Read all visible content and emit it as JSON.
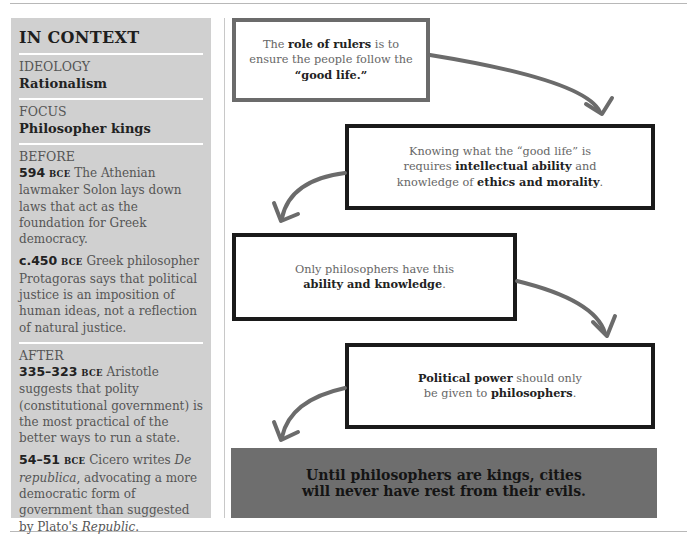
{
  "sidebar": {
    "title": "IN CONTEXT",
    "ideology": {
      "label": "IDEOLOGY",
      "value": "Rationalism"
    },
    "focus": {
      "label": "FOCUS",
      "value": "Philosopher kings"
    },
    "before": {
      "label": "BEFORE",
      "entries": [
        {
          "date": "594",
          "era": "BCE",
          "text": " The Athenian lawmaker Solon lays down laws that act as the foundation for Greek democracy."
        },
        {
          "date": "c.450",
          "era": "BCE",
          "text": " Greek philosopher Protagoras says that political justice is an imposition of human ideas, not a reflection of natural justice."
        }
      ]
    },
    "after": {
      "label": "AFTER",
      "entries": [
        {
          "date": "335–323",
          "era": "BCE",
          "text": " Aristotle suggests that polity (constitutional government) is the most practical of the better ways to run a state."
        },
        {
          "date": "54–51",
          "era": "BCE",
          "text_a": " Cicero writes ",
          "italic_a": "De republica",
          "text_b": ", advocating a more democratic form of government than suggested by Plato's ",
          "italic_b": "Republic",
          "text_c": "."
        }
      ]
    }
  },
  "flow": {
    "box1": {
      "t1": "The ",
      "b1": "role of rulers",
      "t2": " is to ensure the people follow the ",
      "b2": "“good life.”"
    },
    "box2": {
      "t1": "Knowing what the “good life” is requires ",
      "b1": "intellectual ability",
      "t2": " and knowledge of ",
      "b2": "ethics and morality",
      "t3": "."
    },
    "box3": {
      "t1": "Only philosophers have this ",
      "b1": "ability and knowledge",
      "t2": "."
    },
    "box4": {
      "b1": "Political power",
      "t1": " should only be given to ",
      "b2": "philosophers",
      "t2": "."
    },
    "conclusion": {
      "line1": "Until philosophers are kings, cities",
      "line2": "will never have rest from their evils."
    }
  },
  "colors": {
    "sidebar_bg": "#d0d0d0",
    "conclusion_bg": "#6e6e6e",
    "arrow": "#6b6b6b",
    "box_border_grey": "#6b6b6b",
    "box_border_black": "#1a1a1a"
  }
}
